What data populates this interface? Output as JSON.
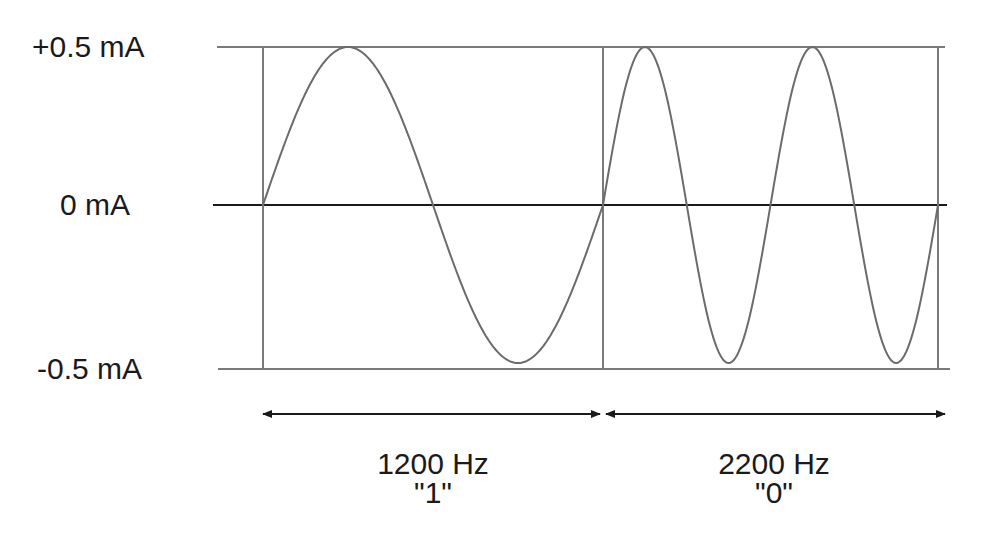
{
  "diagram": {
    "title": "",
    "y_axis_labels": {
      "top": "+0.5 mA",
      "middle": "0 mA",
      "bottom": "-0.5 mA"
    },
    "segments": [
      {
        "frequency": "1200 Hz",
        "bit": "\"1\"",
        "cycles": 1
      },
      {
        "frequency": "2200 Hz",
        "bit": "\"0\"",
        "cycles": 2
      }
    ],
    "colors": {
      "waveform": "#6b6b6b",
      "grid": "#7a7a7a",
      "zero_line": "#1a1a1a",
      "arrow": "#1a1a1a",
      "text": "#1a1a1a"
    }
  },
  "chart_data": {
    "type": "line",
    "title": "",
    "xlabel": "",
    "ylabel": "Current",
    "ylim": [
      -0.5,
      0.5
    ],
    "y_ticks": [
      "+0.5 mA",
      "0 mA",
      "-0.5 mA"
    ],
    "series": [
      {
        "name": "1200 Hz \"1\"",
        "frequency_hz": 1200,
        "cycles_shown": 1,
        "amplitude_mA": 0.5
      },
      {
        "name": "2200 Hz \"0\"",
        "frequency_hz": 2200,
        "cycles_shown": 2,
        "amplitude_mA": 0.5
      }
    ]
  }
}
